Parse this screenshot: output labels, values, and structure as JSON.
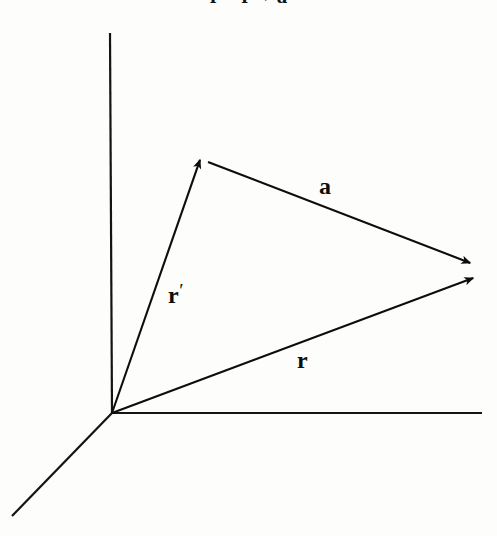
{
  "figure": {
    "background_color": "#fdfdfc",
    "ink_color": "#0d0d0d",
    "width": 497,
    "height": 536
  },
  "caption": {
    "visible_fragment": "r = r′ + a",
    "note": "top line is cropped; only the lower sliver of the glyphs is rendered"
  },
  "axes": {
    "origin": {
      "x": 112,
      "y": 413
    },
    "items": [
      {
        "name": "vertical-axis",
        "from": {
          "x": 110,
          "y": 33
        },
        "to": {
          "x": 112,
          "y": 413
        },
        "stroke_width": 2.2,
        "arrowhead": false
      },
      {
        "name": "horizontal-axis",
        "from": {
          "x": 112,
          "y": 413
        },
        "to": {
          "x": 482,
          "y": 413
        },
        "stroke_width": 2.2,
        "arrowhead": false
      },
      {
        "name": "depth-axis",
        "from": {
          "x": 112,
          "y": 413
        },
        "to": {
          "x": 12,
          "y": 516
        },
        "stroke_width": 2.2,
        "arrowhead": false
      }
    ]
  },
  "vectors": [
    {
      "name": "r-prime",
      "label": "r",
      "prime": "′",
      "from": {
        "x": 112,
        "y": 413
      },
      "to": {
        "x": 201,
        "y": 157
      },
      "stroke_width": 2.1,
      "arrowhead": true,
      "label_position": {
        "x": 168,
        "y": 281
      }
    },
    {
      "name": "a",
      "label": "a",
      "prime": "",
      "from": {
        "x": 208,
        "y": 162
      },
      "to": {
        "x": 473,
        "y": 264
      },
      "stroke_width": 2.1,
      "arrowhead": true,
      "label_position": {
        "x": 319,
        "y": 174
      }
    },
    {
      "name": "r",
      "label": "r",
      "prime": "",
      "from": {
        "x": 112,
        "y": 413
      },
      "to": {
        "x": 476,
        "y": 277
      },
      "stroke_width": 2.1,
      "arrowhead": true,
      "label_position": {
        "x": 297,
        "y": 348
      }
    }
  ],
  "labels": {
    "a": "a",
    "r_prime": "r",
    "r_prime_mark": "′",
    "r": "r"
  },
  "equation": {
    "lhs": "r",
    "operator_1": "=",
    "term_1": "r",
    "term_1_prime": "′",
    "operator_2": "+",
    "term_2": "a"
  }
}
